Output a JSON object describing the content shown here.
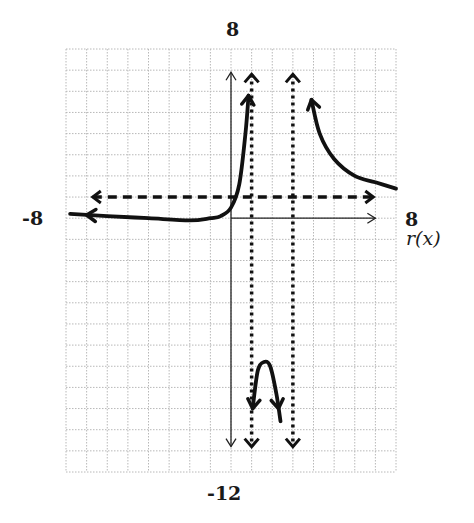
{
  "chart_data": {
    "type": "line",
    "title": "",
    "function_label": "r(x)",
    "xlim": [
      -8,
      8
    ],
    "ylim": [
      -12,
      8
    ],
    "grid": true,
    "grid_step": 1,
    "axis_labels": {
      "x_min": "-8",
      "x_max": "8",
      "y_max": "8",
      "y_min": "-12"
    },
    "asymptotes": {
      "vertical": [
        1,
        3
      ],
      "horizontal": [
        1
      ]
    },
    "series": [
      {
        "name": "r(x) left branch",
        "x": [
          -7.8,
          -6,
          -4,
          -2,
          -1,
          -0.5,
          0,
          0.4,
          0.7,
          0.85
        ],
        "y": [
          0.2,
          0.1,
          0.0,
          -0.1,
          0.0,
          0.1,
          0.5,
          1.6,
          4.0,
          5.8
        ]
      },
      {
        "name": "r(x) middle branch",
        "x": [
          1.05,
          1.3,
          1.6,
          1.9,
          2.2,
          2.4
        ],
        "y": [
          -9.0,
          -7.2,
          -6.8,
          -7.0,
          -8.3,
          -9.6
        ]
      },
      {
        "name": "r(x) right branch",
        "x": [
          3.9,
          4.3,
          5,
          6,
          7,
          8
        ],
        "y": [
          5.6,
          4.0,
          2.8,
          2.0,
          1.7,
          1.4
        ]
      }
    ]
  },
  "labels": {
    "top": "8",
    "bottom": "-12",
    "left": "-8",
    "right": "8",
    "func": "r(x)"
  },
  "colors": {
    "curve": "#111111",
    "grid": "#b8b8b8",
    "axis": "#222222",
    "asymptote": "#111111",
    "background": "#ffffff"
  }
}
